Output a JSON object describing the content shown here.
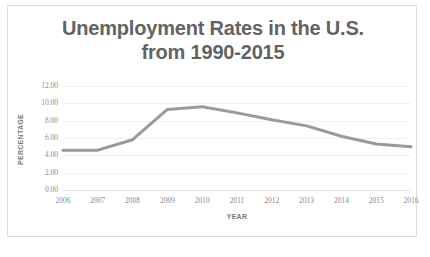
{
  "chart_data": {
    "type": "line",
    "title": "Unemployment Rates in the U.S. from 1990-2015",
    "title_lines": [
      "Unemployment Rates in the U.S.",
      "from 1990-2015"
    ],
    "xlabel": "YEAR",
    "ylabel": "PERCENTAGE",
    "categories": [
      2006,
      2007,
      2008,
      2009,
      2010,
      2011,
      2012,
      2013,
      2014,
      2015,
      2016
    ],
    "x_tick_labels": [
      "2006",
      "2007",
      "2008",
      "2009",
      "2010",
      "2011",
      "2012",
      "2013",
      "2014",
      "2015",
      "2016"
    ],
    "values": [
      4.6,
      4.6,
      5.8,
      9.3,
      9.6,
      8.9,
      8.1,
      7.4,
      6.2,
      5.3,
      5.0
    ],
    "series": [
      {
        "name": "Unemployment Rate",
        "values": [
          4.6,
          4.6,
          5.8,
          9.3,
          9.6,
          8.9,
          8.1,
          7.4,
          6.2,
          5.3,
          5.0
        ]
      }
    ],
    "ylim": [
      0.0,
      12.0
    ],
    "y_tick_step": 2.0,
    "y_tick_labels": [
      "12.00",
      "10.00",
      "8.00",
      "6.00",
      "4.00",
      "2.00",
      "0.00"
    ],
    "y_tick_values": [
      12.0,
      10.0,
      8.0,
      6.0,
      4.0,
      2.0,
      0.0
    ],
    "grid": true,
    "legend": false,
    "legend_position": "none",
    "colors": {
      "line": "#9a9a9a",
      "gridline": "#f0f0f0",
      "axis": "#e3e3e3",
      "title_text": "#636363",
      "tick_text": "#8a8a8a",
      "axis_title_text": "#787878",
      "card_border": "#dcdcdc",
      "background": "#ffffff"
    },
    "line_width": 3
  }
}
